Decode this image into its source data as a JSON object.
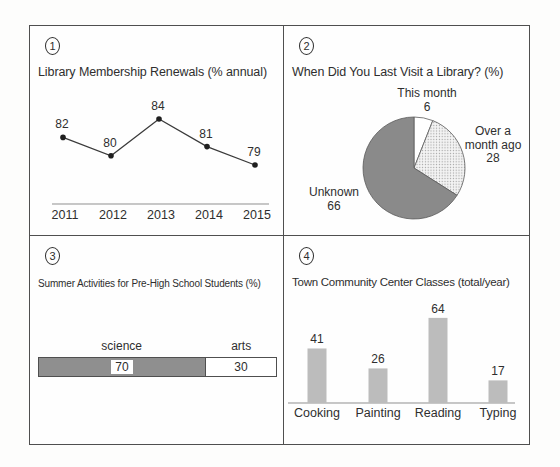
{
  "panels": {
    "p1": {
      "number": "1",
      "title": "Library Membership Renewals (% annual)"
    },
    "p2": {
      "number": "2",
      "title": "When Did You Last Visit a Library? (%)"
    },
    "p3": {
      "number": "3",
      "title": "Summer Activities for Pre-High School Students (%)"
    },
    "p4": {
      "number": "4",
      "title": "Town Community Center Classes (total/year)"
    }
  },
  "chart_data": [
    {
      "type": "line",
      "title": "Library Membership Renewals (% annual)",
      "x": [
        "2011",
        "2012",
        "2013",
        "2014",
        "2015"
      ],
      "values": [
        82,
        80,
        84,
        81,
        79
      ],
      "data_labels": true,
      "line_color": "#3a3a3a",
      "point_color": "#1f1f1f",
      "x_axis_line": true
    },
    {
      "type": "pie",
      "title": "When Did You Last Visit a Library? (%)",
      "labels": [
        "This month",
        "Over a month ago",
        "Unknown"
      ],
      "values": [
        6,
        28,
        66
      ],
      "colors": [
        "#ffffff",
        "dotted-light-gray",
        "#8a8a8a"
      ],
      "start": "12 o'clock",
      "direction": "clockwise"
    },
    {
      "type": "bar",
      "subtype": "horizontal-stacked",
      "title": "Summer Activities for Pre-High School Students (%)",
      "categories": [
        "science",
        "arts"
      ],
      "values": [
        70,
        30
      ],
      "colors": [
        "#8f8f8f",
        "#ffffff"
      ],
      "xlim": [
        0,
        100
      ]
    },
    {
      "type": "bar",
      "title": "Town Community Center Classes (total/year)",
      "categories": [
        "Cooking",
        "Painting",
        "Reading",
        "Typing"
      ],
      "values": [
        41,
        26,
        64,
        17
      ],
      "bar_color": "#bcbcbc",
      "data_labels": true
    }
  ]
}
